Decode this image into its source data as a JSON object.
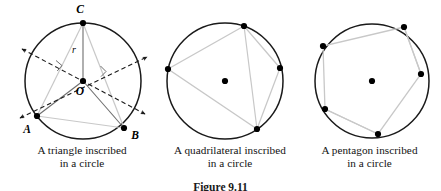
{
  "figure": {
    "number_label": "Figure 9.11",
    "background_color": "#ffffff",
    "circle_stroke_color": "#1a1a1a",
    "chord_stroke_color": "#c8c8c8",
    "dashed_line_color": "#1a1a1a",
    "point_fill_color": "#000000"
  },
  "panels": [
    {
      "id": "triangle",
      "caption_line1": "A triangle inscribed",
      "caption_line2": "in a circle",
      "circle": {
        "cx": 83,
        "cy": 81,
        "r": 58
      },
      "center_point_label": "O",
      "radius_label": "r",
      "vertices": [
        {
          "label": "C",
          "x": 83,
          "y": 23
        },
        {
          "label": "A",
          "x": 37,
          "y": 116
        },
        {
          "label": "B",
          "x": 124,
          "y": 128
        }
      ],
      "has_perpendicular_bisectors": true,
      "right_angle_marks": 2,
      "bisector_arrows": 4
    },
    {
      "id": "quadrilateral",
      "caption_line1": "A quadrilateral inscribed",
      "caption_line2": "in a circle",
      "circle": {
        "cx": 225,
        "cy": 81,
        "r": 58
      },
      "center_point_label": "",
      "vertices": [
        {
          "label": "",
          "x": 244,
          "y": 26
        },
        {
          "label": "",
          "x": 168,
          "y": 69
        },
        {
          "label": "",
          "x": 257,
          "y": 129
        },
        {
          "label": "",
          "x": 280,
          "y": 68
        }
      ]
    },
    {
      "id": "pentagon",
      "caption_line1": "A pentagon inscribed",
      "caption_line2": "in a circle",
      "circle": {
        "cx": 372,
        "cy": 81,
        "r": 57
      },
      "center_point_label": "",
      "vertices": [
        {
          "label": "",
          "x": 404,
          "y": 27
        },
        {
          "label": "",
          "x": 323,
          "y": 46
        },
        {
          "label": "",
          "x": 325,
          "y": 109
        },
        {
          "label": "",
          "x": 378,
          "y": 134
        },
        {
          "label": "",
          "x": 421,
          "y": 74
        }
      ]
    }
  ]
}
